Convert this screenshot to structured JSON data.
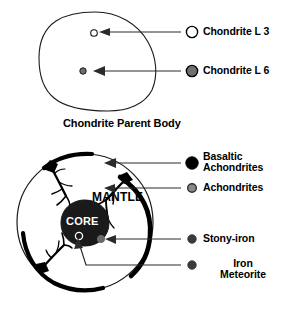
{
  "figure": {
    "title_caption": "Chondrite Parent Body",
    "top_diagram": {
      "name": "chondrite-parent-body",
      "interior_markers": [
        {
          "id": "chondrite-l3-marker",
          "style": "hollow-circle"
        },
        {
          "id": "chondrite-l6-marker",
          "style": "gray-filled-circle"
        }
      ],
      "legend": [
        {
          "id": "chondrite-l3",
          "label": "Chondrite L 3",
          "marker": "hollow-circle",
          "fill": "#ffffff",
          "stroke": "#000000"
        },
        {
          "id": "chondrite-l6",
          "label": "Chondrite L 6",
          "marker": "filled-circle",
          "fill": "#808080",
          "stroke": "#000000"
        }
      ]
    },
    "bottom_diagram": {
      "name": "differentiated-parent-body",
      "labels": {
        "mantle": "MANTLE",
        "core": "CORE"
      },
      "legend": [
        {
          "id": "basaltic-achondrites",
          "label": "Basaltic Achondrites",
          "label_line_1": "Basaltic",
          "label_line_2": "Achondrites",
          "marker": "filled-circle",
          "fill": "#000000",
          "stroke": "#000000"
        },
        {
          "id": "achondrites",
          "label": "Achondrites",
          "marker": "filled-circle",
          "fill": "#808080",
          "stroke": "#3a3a3a"
        },
        {
          "id": "stony-iron",
          "label": "Stony-iron",
          "marker": "filled-circle",
          "fill": "#3a3a3a",
          "stroke": "#3a3a3a"
        },
        {
          "id": "iron-meteorite",
          "label": "Iron Meteorite",
          "label_line_1": "Iron",
          "label_line_2": "Meteorite",
          "marker": "filled-circle",
          "fill": "#3a3a3a",
          "stroke": "#3a3a3a"
        }
      ]
    },
    "colors": {
      "ink": "#000000",
      "gray_marker": "#808080",
      "dark_marker": "#3a3a3a",
      "background": "#ffffff"
    }
  }
}
